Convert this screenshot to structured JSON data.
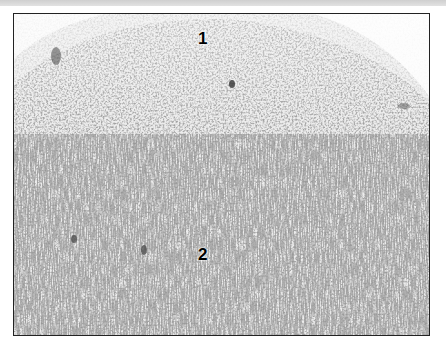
{
  "figure": {
    "type": "grayscale histology micrograph",
    "labels": [
      {
        "text": "1",
        "x": 198,
        "y": 30
      },
      {
        "text": "2",
        "x": 198,
        "y": 246
      }
    ],
    "colors": {
      "frame": "#222222",
      "background": "#ffffff",
      "tissue_light": "#ededed",
      "nuclei": "#5a5a5a"
    }
  }
}
